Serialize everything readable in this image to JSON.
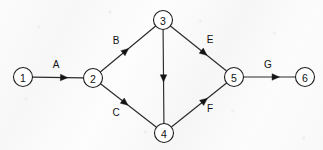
{
  "diagram": {
    "type": "activity-on-arrow-network",
    "canvas": {
      "width": 323,
      "height": 150
    },
    "style": {
      "background_color": "#f9f9f9",
      "line_color": "#2a2a2a",
      "node_fill": "#ffffff",
      "node_stroke": "#1d1d1d",
      "text_color": "#111111",
      "node_radius": 9.5
    },
    "nodes": [
      {
        "id": "n1",
        "label": "1",
        "x": 23,
        "y": 77
      },
      {
        "id": "n2",
        "label": "2",
        "x": 93,
        "y": 78
      },
      {
        "id": "n3",
        "label": "3",
        "x": 163,
        "y": 20
      },
      {
        "id": "n4",
        "label": "4",
        "x": 164,
        "y": 133
      },
      {
        "id": "n5",
        "label": "5",
        "x": 234,
        "y": 77
      },
      {
        "id": "n6",
        "label": "6",
        "x": 305,
        "y": 77
      }
    ],
    "edges": [
      {
        "id": "eA",
        "label": "A",
        "from": "n1",
        "to": "n2",
        "label_x": 56,
        "label_y": 64,
        "arrow_t": 0.62,
        "labelled": true
      },
      {
        "id": "eB",
        "label": "B",
        "from": "n2",
        "to": "n3",
        "label_x": 116,
        "label_y": 40,
        "arrow_t": 0.46,
        "labelled": true
      },
      {
        "id": "eC",
        "label": "C",
        "from": "n2",
        "to": "n4",
        "label_x": 116,
        "label_y": 112,
        "arrow_t": 0.44,
        "labelled": true
      },
      {
        "id": "eD",
        "label": "",
        "from": "n3",
        "to": "n4",
        "label_x": 0,
        "label_y": 0,
        "arrow_t": 0.52,
        "labelled": false
      },
      {
        "id": "eE",
        "label": "E",
        "from": "n3",
        "to": "n5",
        "label_x": 210,
        "label_y": 39,
        "arrow_t": 0.6,
        "labelled": true
      },
      {
        "id": "eF",
        "label": "F",
        "from": "n4",
        "to": "n5",
        "label_x": 210,
        "label_y": 108,
        "arrow_t": 0.6,
        "labelled": true
      },
      {
        "id": "eG",
        "label": "G",
        "from": "n5",
        "to": "n6",
        "label_x": 268,
        "label_y": 64,
        "arrow_t": 0.62,
        "labelled": true
      }
    ]
  }
}
